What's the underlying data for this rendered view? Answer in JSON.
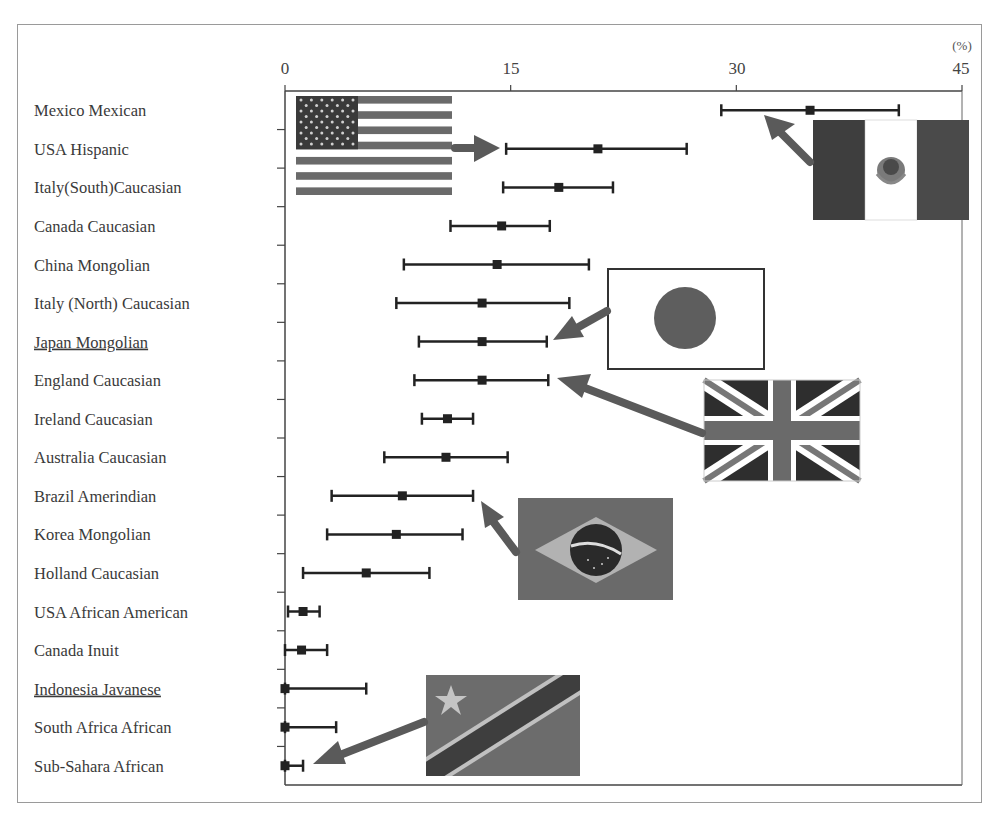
{
  "chart_data": {
    "type": "scatter",
    "subtype": "forest_plot_point_with_error_bars",
    "title": "",
    "xlabel": "",
    "x_unit": "(%)",
    "ylabel": "",
    "xlim": [
      0,
      45
    ],
    "x_ticks": [
      0,
      15,
      30,
      45
    ],
    "x_axis_position": "top",
    "grid": false,
    "legend": null,
    "categories": [
      "Mexico Mexican",
      "USA Hispanic",
      "Italy(South)Caucasian",
      "Canada Caucasian",
      "China Mongolian",
      "Italy (North) Caucasian",
      "Japan Mongolian",
      "England Caucasian",
      "Ireland Caucasian",
      "Australia Caucasian",
      "Brazil Amerindian",
      "Korea Mongolian",
      "Holland Caucasian",
      "USA African American",
      "Canada Inuit",
      "Indonesia Javanese",
      "South Africa African",
      "Sub-Sahara African"
    ],
    "underlined_categories": [
      "Japan Mongolian",
      "Indonesia Javanese"
    ],
    "series": [
      {
        "name": "estimate",
        "values": [
          34.9,
          20.8,
          18.2,
          14.4,
          14.1,
          13.1,
          13.1,
          13.1,
          10.8,
          10.7,
          7.8,
          7.4,
          5.4,
          1.2,
          1.1,
          0.0,
          0.0,
          0.0
        ]
      },
      {
        "name": "lower",
        "values": [
          29.0,
          14.7,
          14.5,
          11.0,
          7.9,
          7.4,
          8.9,
          8.6,
          9.1,
          6.6,
          3.1,
          2.8,
          1.2,
          0.2,
          0.0,
          0.0,
          0.0,
          0.0
        ]
      },
      {
        "name": "upper",
        "values": [
          40.8,
          26.7,
          21.8,
          17.6,
          20.2,
          18.9,
          17.4,
          17.5,
          12.5,
          14.8,
          12.5,
          11.8,
          9.6,
          2.3,
          2.8,
          5.4,
          3.4,
          1.2
        ]
      }
    ],
    "annotations": [
      {
        "type": "flag",
        "country": "USA",
        "points_to": "USA Hispanic"
      },
      {
        "type": "flag",
        "country": "Mexico",
        "points_to": "Mexico Mexican"
      },
      {
        "type": "flag",
        "country": "Japan",
        "points_to": "Japan Mongolian"
      },
      {
        "type": "flag",
        "country": "UK",
        "points_to": "England Caucasian"
      },
      {
        "type": "flag",
        "country": "Brazil",
        "points_to": "Brazil Amerindian"
      },
      {
        "type": "flag",
        "country": "Democratic Republic of the Congo",
        "points_to": "Sub-Sahara African"
      }
    ]
  },
  "axis": {
    "unit_label": "(%)",
    "tick_labels": [
      "0",
      "15",
      "30",
      "45"
    ]
  },
  "colors": {
    "axis": "#444444",
    "bars": "#222222",
    "arrow": "#555555",
    "flag_dark": "#3c3c3c",
    "flag_mid": "#6e6e6e",
    "flag_light": "#a8a8a8"
  }
}
